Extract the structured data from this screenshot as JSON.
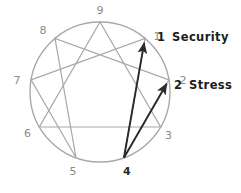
{
  "diagram": {
    "type": "enneagram",
    "colors": {
      "circle_stroke": "#a8a8a8",
      "inner_line_stroke": "#a8a8a8",
      "arrow_stroke": "#2a2a2a",
      "numeral": "#8c8c8c",
      "numeral_emphasis": "#2b2b2b",
      "label_text": "#1c1c1c",
      "background": "#ffffff"
    },
    "geometry": {
      "center_x": 100,
      "center_y": 92,
      "radius": 70,
      "canvas_width": 241,
      "canvas_height": 193
    },
    "points": [
      {
        "id": "p1",
        "number": "1",
        "angle_deg": -50,
        "label_dx": 12,
        "label_dy": 2,
        "emphasis": false
      },
      {
        "id": "p2",
        "number": "2",
        "angle_deg": -10,
        "label_dx": 14,
        "label_dy": 4,
        "emphasis": false
      },
      {
        "id": "p3",
        "number": "3",
        "angle_deg": 30,
        "label_dx": 8,
        "label_dy": 12,
        "emphasis": false
      },
      {
        "id": "p4",
        "number": "4",
        "angle_deg": 70,
        "label_dx": 3,
        "label_dy": 17,
        "emphasis": true
      },
      {
        "id": "p5",
        "number": "5",
        "angle_deg": 110,
        "label_dx": -3,
        "label_dy": 17,
        "emphasis": false
      },
      {
        "id": "p6",
        "number": "6",
        "angle_deg": 150,
        "label_dx": -12,
        "label_dy": 10,
        "emphasis": false
      },
      {
        "id": "p7",
        "number": "7",
        "angle_deg": 190,
        "label_dx": -14,
        "label_dy": 4,
        "emphasis": false
      },
      {
        "id": "p8",
        "number": "8",
        "angle_deg": 230,
        "label_dx": -12,
        "label_dy": -4,
        "emphasis": false
      },
      {
        "id": "p9",
        "number": "9",
        "angle_deg": 270,
        "label_dx": 0,
        "label_dy": -8,
        "emphasis": false
      }
    ],
    "triangle_path": [
      "p9",
      "p3",
      "p6"
    ],
    "hexad_path": [
      "p1",
      "p4",
      "p2",
      "p8",
      "p5",
      "p7"
    ],
    "arrows": [
      {
        "id": "arrow-security",
        "from": "p4",
        "to": "p1",
        "label_number": "1",
        "label_text": "Security"
      },
      {
        "id": "arrow-stress",
        "from": "p4",
        "to": "p2",
        "label_number": "2",
        "label_text": "Stress"
      }
    ],
    "callouts": [
      {
        "id": "callout-security",
        "number": "1",
        "text": "Security",
        "x_num": 157,
        "y": 41,
        "x_text": 172
      },
      {
        "id": "callout-stress",
        "number": "2",
        "text": "Stress",
        "x_num": 174,
        "y": 89,
        "x_text": 189
      }
    ]
  }
}
